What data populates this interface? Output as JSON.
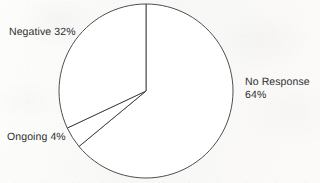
{
  "chart_data": {
    "type": "pie",
    "title": "",
    "subtitle": "",
    "xlabel": "",
    "ylabel": "",
    "legend_position": "none",
    "grid": false,
    "units": "percent",
    "total": 100,
    "categories": [
      "No Response",
      "Negative",
      "Ongoing"
    ],
    "values": [
      64,
      32,
      4
    ],
    "start_angle_deg": 0,
    "direction": "clockwise",
    "slices": [
      {
        "id": "no-response",
        "label": "No Response",
        "value_label": "64%",
        "value": 64,
        "start_deg": 0,
        "sweep_deg": 230.4,
        "fill": "#ffffff",
        "stroke": "#3a3a3c"
      },
      {
        "id": "ongoing",
        "label": "Ongoing",
        "value_label": "4%",
        "value": 4,
        "start_deg": 230.4,
        "sweep_deg": 14.4,
        "fill": "#ffffff",
        "stroke": "#3a3a3c"
      },
      {
        "id": "negative",
        "label": "Negative",
        "value_label": "32%",
        "value": 32,
        "start_deg": 244.8,
        "sweep_deg": 115.2,
        "fill": "#ffffff",
        "stroke": "#3a3a3c"
      }
    ],
    "geometry": {
      "center_x": 146,
      "center_y": 91,
      "radius": 87
    },
    "colors": {
      "background": "#fbfbfa",
      "outline": "#3a3a3c",
      "text": "#2e2e30"
    }
  },
  "labels": {
    "negative": "Negative 32%",
    "no_response_line1": "No Response",
    "no_response_line2": "64%",
    "ongoing": "Ongoing 4%"
  }
}
